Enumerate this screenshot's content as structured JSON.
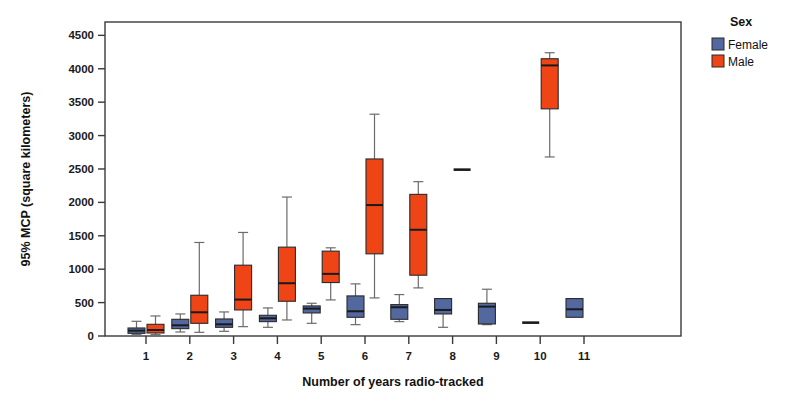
{
  "chart_data": {
    "type": "box",
    "title": "",
    "xlabel": "Number of years radio-tracked",
    "ylabel": "95% MCP (square kilometers)",
    "ylim": [
      0,
      4700
    ],
    "yticks": [
      0,
      500,
      1000,
      1500,
      2000,
      2500,
      3000,
      3500,
      4000,
      4500
    ],
    "ytick_labels": [
      "0",
      "500",
      "1000",
      "1500",
      "2000",
      "2500",
      "3000",
      "3500",
      "4000",
      "4500"
    ],
    "categories": [
      "1",
      "2",
      "3",
      "4",
      "5",
      "6",
      "7",
      "8",
      "9",
      "10",
      "11"
    ],
    "xticks": [
      1,
      2,
      3,
      4,
      5,
      6,
      7,
      8,
      9,
      10,
      11
    ],
    "grid": false,
    "legend": {
      "title": "Sex",
      "position": "top-right",
      "entries": [
        {
          "label": "Female",
          "color": "#53689f"
        },
        {
          "label": "Male",
          "color": "#ef4416"
        }
      ]
    },
    "colors": {
      "female": "#53689f",
      "male": "#ef4416",
      "box_outline": "#2a2a2a",
      "whisker": "#6b6b6b",
      "median": "#1a1a1a",
      "axis": "#3a3a3a",
      "background": "#ffffff"
    },
    "series": [
      {
        "name": "Female",
        "color": "#53689f",
        "boxes": [
          {
            "category": "1",
            "whisker_low": 20,
            "q1": 40,
            "median": 80,
            "q3": 120,
            "whisker_high": 220
          },
          {
            "category": "2",
            "whisker_low": 60,
            "q1": 110,
            "median": 160,
            "q3": 250,
            "whisker_high": 330
          },
          {
            "category": "3",
            "whisker_low": 70,
            "q1": 130,
            "median": 175,
            "q3": 255,
            "whisker_high": 360
          },
          {
            "category": "4",
            "whisker_low": 130,
            "q1": 215,
            "median": 265,
            "q3": 310,
            "whisker_high": 420
          },
          {
            "category": "5",
            "whisker_low": 190,
            "q1": 345,
            "median": 410,
            "q3": 450,
            "whisker_high": 490
          },
          {
            "category": "6",
            "whisker_low": 170,
            "q1": 280,
            "median": 370,
            "q3": 600,
            "whisker_high": 780
          },
          {
            "category": "7",
            "whisker_low": 215,
            "q1": 250,
            "median": 430,
            "q3": 470,
            "whisker_high": 620
          },
          {
            "category": "8",
            "whisker_low": 130,
            "q1": 330,
            "median": 390,
            "q3": 560,
            "whisker_high": 560
          },
          {
            "category": "9",
            "whisker_low": 170,
            "q1": 180,
            "median": 440,
            "q3": 490,
            "whisker_high": 700
          },
          {
            "category": "10",
            "whisker_low": 200,
            "q1": 200,
            "median": 200,
            "q3": 200,
            "whisker_high": 200
          },
          {
            "category": "11",
            "whisker_low": 280,
            "q1": 280,
            "median": 400,
            "q3": 560,
            "whisker_high": 560
          }
        ]
      },
      {
        "name": "Male",
        "color": "#ef4416",
        "boxes": [
          {
            "category": "1",
            "whisker_low": 20,
            "q1": 45,
            "median": 90,
            "q3": 175,
            "whisker_high": 300
          },
          {
            "category": "2",
            "whisker_low": 55,
            "q1": 190,
            "median": 355,
            "q3": 610,
            "whisker_high": 1400
          },
          {
            "category": "3",
            "whisker_low": 140,
            "q1": 390,
            "median": 545,
            "q3": 1060,
            "whisker_high": 1550
          },
          {
            "category": "4",
            "whisker_low": 240,
            "q1": 520,
            "median": 790,
            "q3": 1330,
            "whisker_high": 2080
          },
          {
            "category": "5",
            "whisker_low": 540,
            "q1": 800,
            "median": 930,
            "q3": 1270,
            "whisker_high": 1320
          },
          {
            "category": "6",
            "whisker_low": 570,
            "q1": 1230,
            "median": 1960,
            "q3": 2650,
            "whisker_high": 3320
          },
          {
            "category": "7",
            "whisker_low": 720,
            "q1": 910,
            "median": 1590,
            "q3": 2120,
            "whisker_high": 2310
          },
          {
            "category": "8",
            "whisker_low": 2490,
            "q1": 2490,
            "median": 2490,
            "q3": 2490,
            "whisker_high": 2490
          },
          {
            "category": "9",
            "whisker_low": null,
            "q1": null,
            "median": null,
            "q3": null,
            "whisker_high": null
          },
          {
            "category": "10",
            "whisker_low": 2680,
            "q1": 3400,
            "median": 4050,
            "q3": 4150,
            "whisker_high": 4240
          },
          {
            "category": "11",
            "whisker_low": null,
            "q1": null,
            "median": null,
            "q3": null,
            "whisker_high": null
          }
        ]
      }
    ]
  }
}
